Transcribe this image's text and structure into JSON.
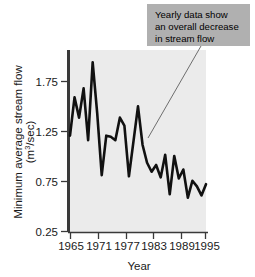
{
  "chart_data": {
    "type": "line",
    "title": "",
    "xlabel": "Year",
    "ylabel": "Minimum average stream flow (m³/sec)",
    "ylabel_line1": "Minimum average stream flow",
    "ylabel_line2_pre": "(m",
    "ylabel_line2_sup": "3",
    "ylabel_line2_post": "/sec)",
    "xlim": [
      1965,
      1995
    ],
    "ylim": [
      0.25,
      1.86
    ],
    "grid": false,
    "legend": "none",
    "xticks": [
      1965,
      1971,
      1977,
      1983,
      1989,
      1995
    ],
    "xtick_labels": [
      "1965",
      "1971",
      "1977",
      "1983",
      "1989",
      "1995"
    ],
    "yticks": [
      0.25,
      0.75,
      1.25,
      1.75
    ],
    "ytick_labels": [
      "0.25",
      "0.75",
      "1.25",
      "1.75"
    ],
    "series": [
      {
        "name": "Minimum average stream flow",
        "color": "#111111",
        "x": [
          1965,
          1966,
          1967,
          1968,
          1969,
          1970,
          1971,
          1972,
          1973,
          1974,
          1975,
          1976,
          1977,
          1978,
          1979,
          1980,
          1981,
          1982,
          1983,
          1984,
          1985,
          1986,
          1987,
          1988,
          1989,
          1990,
          1991,
          1992,
          1993,
          1994,
          1995
        ],
        "values": [
          1.1,
          1.44,
          1.26,
          1.52,
          1.06,
          1.75,
          1.3,
          0.75,
          1.1,
          1.09,
          1.06,
          1.26,
          1.19,
          0.74,
          1.05,
          1.36,
          1.02,
          0.86,
          0.78,
          0.84,
          0.73,
          0.93,
          0.58,
          0.92,
          0.72,
          0.8,
          0.55,
          0.7,
          0.65,
          0.57,
          0.67
        ]
      }
    ],
    "annotations": [
      {
        "name": "trend-callout",
        "lines": [
          "Yearly data show",
          "an overall decrease",
          "in stream flow"
        ],
        "box_color": "#b0b0b0",
        "text_color": "#000000",
        "leader_from": [
          201,
          46
        ],
        "leader_to": [
          148,
          138
        ]
      }
    ],
    "plot_bg": "#ebebeb",
    "axis_color": "#3a3a3a"
  }
}
